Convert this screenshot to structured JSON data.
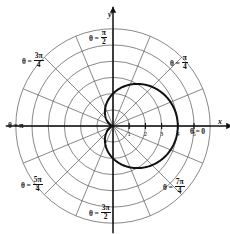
{
  "chart_data": {
    "type": "line",
    "subtype": "polar",
    "title": "",
    "curve_name": "cardioid",
    "equation": "r = 2(1 + cos(theta))",
    "theta_range_deg": [
      0,
      360
    ],
    "r_max_curve": 4,
    "curve_color": "#111111",
    "curve_width": 2.0,
    "grid": {
      "on": true,
      "circle_radii": [
        1,
        2,
        3,
        4,
        5,
        6
      ],
      "radial_spokes_deg": [
        0,
        22.5,
        45,
        67.5,
        90,
        112.5,
        135,
        157.5,
        180,
        202.5,
        225,
        247.5,
        270,
        292.5,
        315,
        337.5
      ],
      "grid_color": "#555555"
    },
    "axes": {
      "x_label": "x",
      "y_label": "y",
      "x_ticks": [
        1,
        2,
        3,
        4,
        5
      ],
      "x_tick_labels": [
        "1",
        "2",
        "3",
        "4",
        "5"
      ],
      "axis_color": "#111111"
    },
    "angle_labels": [
      {
        "id": "theta-0",
        "text_plain": "θ = 0",
        "theta": "θ",
        "eq": "=",
        "value": "0",
        "kind": "plain",
        "angle_deg": 0
      },
      {
        "id": "theta-pi-4",
        "text_plain": "θ = π/4",
        "theta": "θ",
        "eq": "=",
        "num": "π",
        "den": "4",
        "kind": "fraction",
        "angle_deg": 45
      },
      {
        "id": "theta-pi-2",
        "text_plain": "θ = π/2",
        "theta": "θ",
        "eq": "=",
        "num": "π",
        "den": "2",
        "kind": "fraction",
        "angle_deg": 90
      },
      {
        "id": "theta-3pi-4",
        "text_plain": "θ = 3π/4",
        "theta": "θ",
        "eq": "=",
        "num": "3π",
        "den": "4",
        "kind": "fraction",
        "angle_deg": 135
      },
      {
        "id": "theta-pi",
        "text_plain": "θ = π",
        "theta": "θ",
        "eq": "=",
        "value": "π",
        "kind": "plain",
        "angle_deg": 180
      },
      {
        "id": "theta-5pi-4",
        "text_plain": "θ = 5π/4",
        "theta": "θ",
        "eq": "=",
        "num": "5π",
        "den": "4",
        "kind": "fraction",
        "angle_deg": 225
      },
      {
        "id": "theta-3pi-2",
        "text_plain": "θ = 3π/2",
        "theta": "θ",
        "eq": "=",
        "num": "3π",
        "den": "2",
        "kind": "fraction",
        "angle_deg": 270
      },
      {
        "id": "theta-7pi-4",
        "text_plain": "θ = 7π/4",
        "theta": "θ",
        "eq": "=",
        "num": "7π",
        "den": "4",
        "kind": "fraction",
        "angle_deg": 315
      }
    ],
    "center_px": {
      "x": 113,
      "y": 126
    },
    "px_per_unit": 16.2,
    "background": "#ffffff"
  }
}
